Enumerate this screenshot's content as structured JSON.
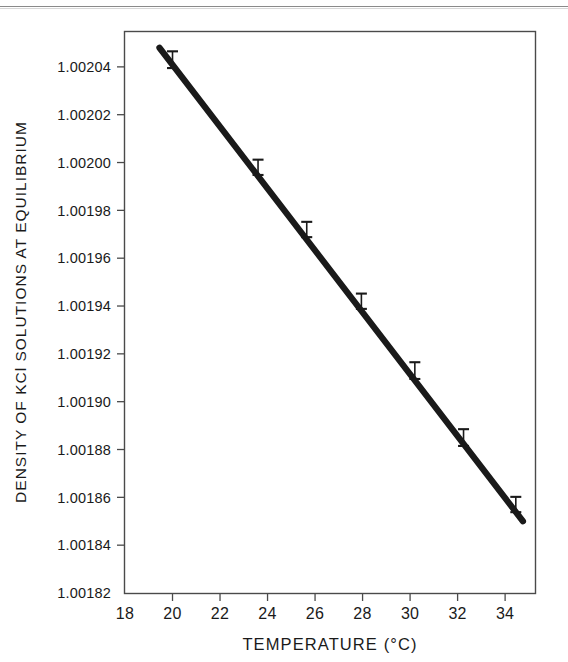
{
  "figure": {
    "background_color": "#ffffff",
    "ink_color": "#1a1a1a",
    "axis_color": "#4a4a4a",
    "top_rule": "horizontal-scan-rule"
  },
  "chart_data": {
    "type": "line",
    "title": "",
    "subtitle": "",
    "xlabel": "TEMPERATURE (°C)",
    "ylabel": "DENSITY OF KCl SOLUTIONS AT EQUILIBRIUM",
    "xlim": [
      18,
      35.3
    ],
    "ylim": [
      1.00182,
      1.002055
    ],
    "grid": false,
    "legend": null,
    "xticks": [
      18,
      20,
      22,
      24,
      26,
      28,
      30,
      32,
      34
    ],
    "xticklabels": [
      "18",
      "20",
      "22",
      "24",
      "26",
      "28",
      "30",
      "32",
      "34"
    ],
    "yticks": [
      1.00182,
      1.00184,
      1.00186,
      1.00188,
      1.0019,
      1.00192,
      1.00194,
      1.00196,
      1.00198,
      1.002,
      1.00202,
      1.00204
    ],
    "yticklabels": [
      "1.00182",
      "1.00184",
      "1.00186",
      "1.00188",
      "1.00190",
      "1.00192",
      "1.00194",
      "1.00196",
      "1.00198",
      "1.00200",
      "1.00202",
      "1.00204"
    ],
    "series": [
      {
        "name": "Density of KCl solutions at equilibrium",
        "style": "thick-straight-line-with-error-bars",
        "line_fit_endpoints": [
          {
            "x": 19.45,
            "y": 1.002048
          },
          {
            "x": 34.75,
            "y": 1.00185
          }
        ],
        "x": [
          20.0,
          23.6,
          25.65,
          27.95,
          30.2,
          32.25,
          34.45
        ],
        "y": [
          1.002043,
          1.001998,
          1.001972,
          1.001942,
          1.001913,
          1.001885,
          1.001857
        ],
        "yerr": [
          3.5e-06,
          3.2e-06,
          3.2e-06,
          3.2e-06,
          3.5e-06,
          3.5e-06,
          3.2e-06
        ]
      }
    ]
  }
}
